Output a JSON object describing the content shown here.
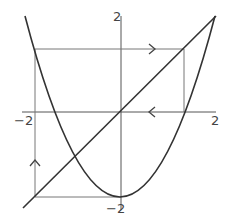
{
  "axes": {
    "x_min_label": "−2",
    "x_max_label": "2",
    "y_max_label": "2",
    "y_min_label": "−2",
    "x_range": [
      -2,
      2
    ],
    "y_range": [
      -2,
      2
    ]
  },
  "curves": [
    {
      "name": "parabola",
      "expression": "x^2 - 2"
    },
    {
      "name": "diagonal",
      "expression": "y = x"
    }
  ],
  "orbit": {
    "points": [
      1.414,
      0,
      -2,
      2
    ],
    "arrows": [
      {
        "direction": "right",
        "at": "top segment"
      },
      {
        "direction": "left",
        "at": "x-axis segment"
      },
      {
        "direction": "up",
        "at": "left vertical segment"
      }
    ]
  },
  "colors": {
    "curve": "#333333",
    "axis": "#555555",
    "orbit": "#777777",
    "background": "#ffffff"
  }
}
